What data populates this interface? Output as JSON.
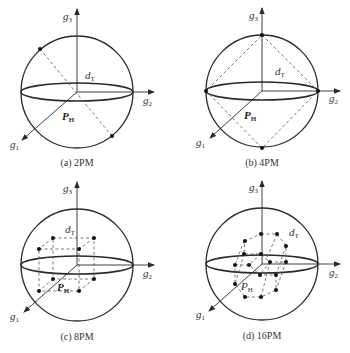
{
  "figure": {
    "axes": {
      "g1": "g",
      "g1_sub": "1",
      "g2": "g",
      "g2_sub": "2",
      "g3": "g",
      "g3_sub": "3"
    },
    "labels": {
      "dT": "d",
      "dT_sub": "T",
      "PH": "P",
      "PH_sub": "H"
    },
    "panels": [
      {
        "id": "a",
        "caption": "(a) 2PM",
        "points": 2
      },
      {
        "id": "b",
        "caption": "(b) 4PM",
        "points": 4
      },
      {
        "id": "c",
        "caption": "(c) 8PM",
        "points": 8
      },
      {
        "id": "d",
        "caption": "(d) 16PM",
        "points": 16
      }
    ]
  }
}
